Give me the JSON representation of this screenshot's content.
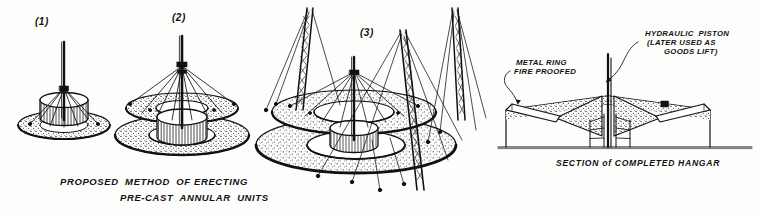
{
  "drawing": {
    "title_lines": [
      "PROPOSED  METHOD  OF ERECTING",
      "PRE-CAST  ANNULAR  UNITS"
    ],
    "section_caption": "SECTION of COMPLETED HANGAR",
    "background_color": "#fdfdfc",
    "ink_color": "#111111"
  },
  "panels": [
    {
      "number": "(1)",
      "name": "stage-one-single-unit"
    },
    {
      "number": "(2)",
      "name": "stage-two-first-annular-ring"
    },
    {
      "number": "(3)",
      "name": "stage-three-derricks-and-rings"
    }
  ],
  "annotations": [
    {
      "id": "metal-ring",
      "lines": [
        "METAL RING",
        "FIRE PROOFED"
      ]
    },
    {
      "id": "hydraulic-piston",
      "lines": [
        "HYDRAULIC  PISTON",
        "(LATER USED AS",
        "GOODS LIFT)"
      ]
    }
  ]
}
